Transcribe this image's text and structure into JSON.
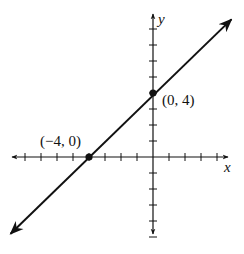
{
  "chart_data": {
    "type": "line",
    "title": "",
    "xlabel": "x",
    "ylabel": "y",
    "xlim": [
      -8,
      4
    ],
    "ylim": [
      -5,
      8
    ],
    "grid": false,
    "tick_spacing": 1,
    "series": [
      {
        "name": "line through (-4, 0) and (0, 4)",
        "equation": "y = x + 4",
        "slope": 1,
        "intercept": 4,
        "x": [
          -8.9,
          4.9
        ],
        "y": [
          -4.8,
          8.6
        ],
        "arrows_both_ends": true
      }
    ],
    "points": [
      {
        "x": -4,
        "y": 0,
        "label": "(−4, 0)"
      },
      {
        "x": 0,
        "y": 4,
        "label": "(0, 4)"
      }
    ]
  },
  "labels": {
    "x_axis": "x",
    "y_axis": "y",
    "point_a": "(−4, 0)",
    "point_b": "(0, 4)"
  },
  "colors": {
    "ink": "#111111",
    "background": "#ffffff"
  }
}
